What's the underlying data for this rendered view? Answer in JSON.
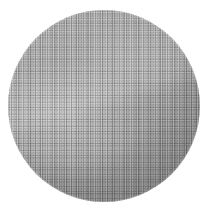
{
  "image": {
    "kind": "photograph",
    "subject_name": "woven-wire-mesh-disc",
    "background_color": "#ffffff",
    "canvas": {
      "width_px": 222,
      "height_px": 215
    },
    "alt_text": "Grayscale photograph of a circular woven wire mesh filter disc on a plain white background",
    "caption": ""
  },
  "disc": {
    "shape": "circle",
    "center_x_px": 104,
    "center_y_px": 106,
    "diameter_px": 192,
    "base_color": "#a2a2a2",
    "rim_shadow_color": "#7d7d7d",
    "highlight_color": "#c8c8c8",
    "surface": "fine-woven-mesh",
    "weave_pitch_px": 2.4
  },
  "shading": {
    "highlight_position": "left-of-center",
    "dark_band_position": "upper-left-rim",
    "diagonal_boundary": "upper-right-to-lower-left"
  },
  "labels": {
    "title": "",
    "annotation": ""
  }
}
